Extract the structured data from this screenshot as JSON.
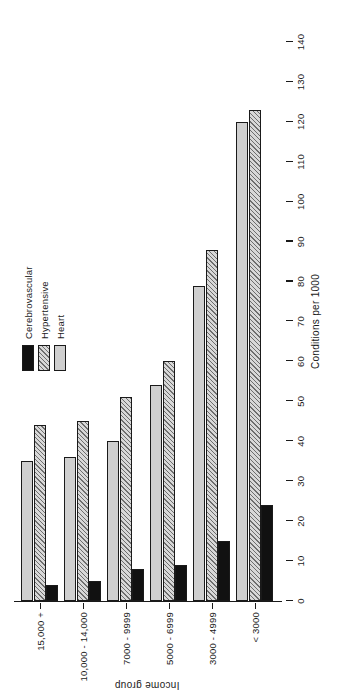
{
  "chart_data": {
    "type": "bar",
    "orientation": "horizontal-rotated",
    "title": "",
    "xlabel": "Income group",
    "ylabel": "Conditions per 1000",
    "ylim": [
      0,
      140
    ],
    "ytick_step": 10,
    "yticks": [
      0,
      10,
      20,
      30,
      40,
      50,
      60,
      70,
      80,
      90,
      100,
      110,
      120,
      130,
      140
    ],
    "ytick_labels": [
      "0",
      "10",
      "20",
      "30",
      "40",
      "50",
      "60",
      "70",
      "80",
      "90",
      "100",
      "110",
      "120",
      "130",
      "140"
    ],
    "grid": false,
    "legend_position": "upper-left",
    "categories": [
      "< 3000",
      "3000 - 4999",
      "5000 - 6999",
      "7000 - 9999",
      "10,000 - 14,000",
      "15,000 +"
    ],
    "series": [
      {
        "name": "Cerebrovascular",
        "color": "#111111",
        "fill": "solid-black",
        "values": [
          24,
          15,
          9,
          8,
          5,
          4
        ]
      },
      {
        "name": "Hypertensive",
        "color": "#6e6e6e",
        "fill": "diagonal-hatch",
        "values": [
          123,
          88,
          60,
          51,
          45,
          44
        ]
      },
      {
        "name": "Heart",
        "color": "#cfcfcf",
        "fill": "light-gray",
        "values": [
          120,
          79,
          54,
          40,
          36,
          35
        ]
      }
    ]
  },
  "legend": {
    "entries": [
      {
        "label": "Cerebrovascular",
        "swatch": "solid-black-swatch"
      },
      {
        "label": "Hypertensive",
        "swatch": "hatched-swatch"
      },
      {
        "label": "Heart",
        "swatch": "light-gray-swatch"
      }
    ]
  },
  "axes": {
    "value_axis_title": "Conditions per 1000",
    "category_axis_title": "Income group"
  }
}
